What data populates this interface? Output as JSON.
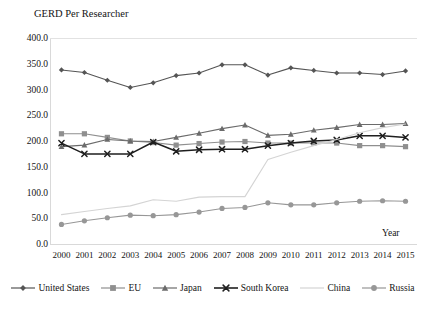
{
  "chart_data": {
    "type": "line",
    "title": "GERD Per Researcher",
    "ylabel": "GERD Per Researcher",
    "xlabel": "Year",
    "ylim": [
      0,
      400
    ],
    "ytick_step": 50,
    "grid": false,
    "legend_position": "bottom",
    "x": [
      2000,
      2001,
      2002,
      2003,
      2004,
      2005,
      2006,
      2007,
      2008,
      2009,
      2010,
      2011,
      2012,
      2013,
      2014,
      2015
    ],
    "categories": [
      "2000",
      "2001",
      "2002",
      "2003",
      "2004",
      "2005",
      "2006",
      "2007",
      "2008",
      "2009",
      "2010",
      "2011",
      "2012",
      "2013",
      "2014",
      "2015"
    ],
    "ytick_labels": [
      "400.0",
      "350.0",
      "300.0",
      "250.0",
      "200.0",
      "150.0",
      "100.0",
      "50.0",
      "0.0"
    ],
    "ytick_values": [
      400,
      350,
      300,
      250,
      200,
      150,
      100,
      50,
      0
    ],
    "series": [
      {
        "name": "United States",
        "marker": "diamond",
        "color": "#555555",
        "values": [
          338,
          333,
          318,
          304,
          313,
          327,
          332,
          348,
          348,
          328,
          342,
          337,
          332,
          332,
          329,
          336
        ]
      },
      {
        "name": "EU",
        "marker": "square",
        "color": "#8f8f8f",
        "values": [
          214,
          214,
          207,
          200,
          197,
          192,
          195,
          198,
          199,
          196,
          196,
          196,
          196,
          191,
          191,
          189
        ]
      },
      {
        "name": "Japan",
        "marker": "triangle",
        "color": "#6b6b6b",
        "values": [
          189,
          192,
          203,
          200,
          199,
          207,
          215,
          224,
          231,
          211,
          213,
          221,
          226,
          232,
          232,
          234
        ]
      },
      {
        "name": "South Korea",
        "marker": "x",
        "color": "#1f1f1f",
        "values": [
          196,
          175,
          175,
          175,
          198,
          180,
          183,
          184,
          184,
          191,
          196,
          200,
          202,
          210,
          210,
          207
        ]
      },
      {
        "name": "China",
        "marker": "none",
        "color": "#d4d4d4",
        "values": [
          57,
          63,
          69,
          74,
          86,
          83,
          91,
          92,
          92,
          164,
          178,
          191,
          203,
          216,
          226,
          233
        ]
      },
      {
        "name": "Russia",
        "marker": "circle",
        "color": "#979797",
        "values": [
          38,
          45,
          51,
          56,
          55,
          57,
          62,
          69,
          71,
          80,
          76,
          76,
          80,
          83,
          84,
          83
        ]
      }
    ]
  },
  "legend": {
    "items": [
      {
        "label": "United States",
        "marker": "diamond-icon"
      },
      {
        "label": "EU",
        "marker": "square-icon"
      },
      {
        "label": "Japan",
        "marker": "triangle-icon"
      },
      {
        "label": "South Korea",
        "marker": "x-icon"
      },
      {
        "label": "China",
        "marker": "line-icon"
      },
      {
        "label": "Russia",
        "marker": "circle-icon"
      }
    ]
  }
}
